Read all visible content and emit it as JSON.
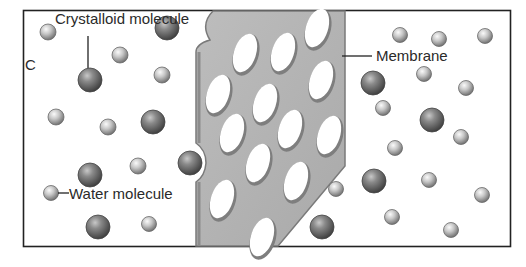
{
  "diagram": {
    "type": "osmosis-membrane-illustration",
    "panel_letter": "C",
    "labels": {
      "crystalloid": "Crystalloid molecule",
      "membrane": "Membrane",
      "water": "Water molecule"
    },
    "colors": {
      "frame": "#222222",
      "membrane_fill": "#b4b4b4",
      "membrane_edge": "#7a7a7a",
      "crystalloid_dark": "#4a4a4a",
      "crystalloid_light": "#9a9a9a",
      "water_dark": "#7d7d7d",
      "water_light": "#f2f2f2"
    },
    "crystalloid_molecules": [
      {
        "x": 167,
        "y": 28,
        "r": 12
      },
      {
        "x": 90,
        "y": 80,
        "r": 12
      },
      {
        "x": 153,
        "y": 122,
        "r": 12
      },
      {
        "x": 190,
        "y": 163,
        "r": 12
      },
      {
        "x": 90,
        "y": 175,
        "r": 12
      },
      {
        "x": 98,
        "y": 227,
        "r": 12
      },
      {
        "x": 373,
        "y": 83,
        "r": 12
      },
      {
        "x": 432,
        "y": 120,
        "r": 12
      },
      {
        "x": 374,
        "y": 181,
        "r": 12
      },
      {
        "x": 322,
        "y": 227,
        "r": 12
      }
    ],
    "water_molecules": [
      {
        "x": 48,
        "y": 32,
        "r": 8
      },
      {
        "x": 120,
        "y": 55,
        "r": 8
      },
      {
        "x": 162,
        "y": 75,
        "r": 8
      },
      {
        "x": 56,
        "y": 117,
        "r": 8
      },
      {
        "x": 108,
        "y": 127,
        "r": 8
      },
      {
        "x": 138,
        "y": 166,
        "r": 8
      },
      {
        "x": 51,
        "y": 193,
        "r": 7.5
      },
      {
        "x": 149,
        "y": 224,
        "r": 7.5
      },
      {
        "x": 400,
        "y": 35,
        "r": 7.5
      },
      {
        "x": 439,
        "y": 39,
        "r": 7.5
      },
      {
        "x": 485,
        "y": 36,
        "r": 7.5
      },
      {
        "x": 424,
        "y": 74,
        "r": 7.5
      },
      {
        "x": 466,
        "y": 88,
        "r": 7.5
      },
      {
        "x": 383,
        "y": 108,
        "r": 7.5
      },
      {
        "x": 461,
        "y": 137,
        "r": 7.5
      },
      {
        "x": 395,
        "y": 148,
        "r": 7.5
      },
      {
        "x": 429,
        "y": 180,
        "r": 7.5
      },
      {
        "x": 482,
        "y": 195,
        "r": 7.5
      },
      {
        "x": 392,
        "y": 217,
        "r": 7.5
      },
      {
        "x": 451,
        "y": 230,
        "r": 7.5
      },
      {
        "x": 336,
        "y": 189,
        "r": 7.5
      }
    ],
    "membrane_pores": [
      {
        "x": 245,
        "y": 53,
        "rx": 11,
        "ry": 20,
        "rot": 18
      },
      {
        "x": 283,
        "y": 52,
        "rx": 11,
        "ry": 20,
        "rot": 18
      },
      {
        "x": 317,
        "y": 28,
        "rx": 11,
        "ry": 20,
        "rot": 18
      },
      {
        "x": 218,
        "y": 94,
        "rx": 11,
        "ry": 20,
        "rot": 18
      },
      {
        "x": 265,
        "y": 103,
        "rx": 11,
        "ry": 20,
        "rot": 18
      },
      {
        "x": 321,
        "y": 80,
        "rx": 11,
        "ry": 20,
        "rot": 18
      },
      {
        "x": 232,
        "y": 133,
        "rx": 11,
        "ry": 20,
        "rot": 18
      },
      {
        "x": 290,
        "y": 129,
        "rx": 11,
        "ry": 20,
        "rot": 18
      },
      {
        "x": 329,
        "y": 135,
        "rx": 11,
        "ry": 20,
        "rot": 18
      },
      {
        "x": 258,
        "y": 163,
        "rx": 11,
        "ry": 20,
        "rot": 18
      },
      {
        "x": 296,
        "y": 181,
        "rx": 11,
        "ry": 20,
        "rot": 18
      },
      {
        "x": 222,
        "y": 199,
        "rx": 11,
        "ry": 20,
        "rot": 18
      },
      {
        "x": 262,
        "y": 237,
        "rx": 11,
        "ry": 20,
        "rot": 18
      }
    ]
  }
}
